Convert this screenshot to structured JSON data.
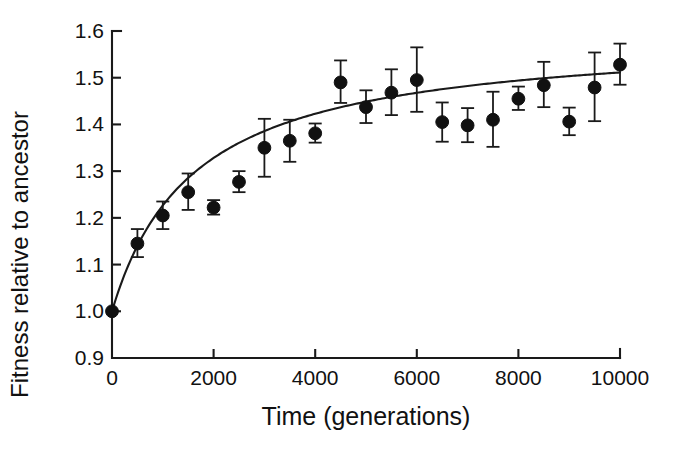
{
  "chart_data": {
    "type": "scatter",
    "title": "",
    "subtitle": "",
    "xlabel": "Time (generations)",
    "ylabel": "Fitness relative to ancestor",
    "xlim": [
      0,
      10000
    ],
    "ylim": [
      0.9,
      1.6
    ],
    "xticks": [
      0,
      2000,
      4000,
      6000,
      8000,
      10000
    ],
    "xtick_labels": [
      "0",
      "2000",
      "4000",
      "6000",
      "8000",
      "10000"
    ],
    "yticks": [
      0.9,
      1.0,
      1.1,
      1.2,
      1.3,
      1.4,
      1.5,
      1.6
    ],
    "ytick_labels": [
      "0.9",
      "1.0",
      "1.1",
      "1.2",
      "1.3",
      "1.4",
      "1.5",
      "1.6"
    ],
    "grid": false,
    "legend": null,
    "marker": "filled-circle",
    "error_bars": "vertical",
    "x": [
      0,
      500,
      1000,
      1500,
      2000,
      2500,
      3000,
      3500,
      4000,
      4500,
      5000,
      5500,
      6000,
      6500,
      7000,
      7500,
      8000,
      8500,
      9000,
      9500,
      10000
    ],
    "y": [
      1.0,
      1.145,
      1.205,
      1.255,
      1.222,
      1.277,
      1.35,
      1.365,
      1.381,
      1.49,
      1.437,
      1.468,
      1.495,
      1.405,
      1.398,
      1.41,
      1.455,
      1.484,
      1.406,
      1.479,
      1.528
    ],
    "yerr_lower": [
      0.0,
      0.029,
      0.029,
      0.038,
      0.015,
      0.022,
      0.062,
      0.045,
      0.02,
      0.044,
      0.034,
      0.048,
      0.068,
      0.042,
      0.036,
      0.058,
      0.024,
      0.047,
      0.029,
      0.072,
      0.043
    ],
    "yerr_upper": [
      0.0,
      0.031,
      0.03,
      0.04,
      0.016,
      0.023,
      0.062,
      0.045,
      0.021,
      0.047,
      0.036,
      0.05,
      0.07,
      0.042,
      0.037,
      0.06,
      0.026,
      0.05,
      0.03,
      0.075,
      0.045
    ],
    "fit_curve": {
      "name": "hyperbolic fit",
      "equation_form": "w(t) = 1 + a*t/(t + b)",
      "a": 0.594,
      "b": 1620
    }
  }
}
